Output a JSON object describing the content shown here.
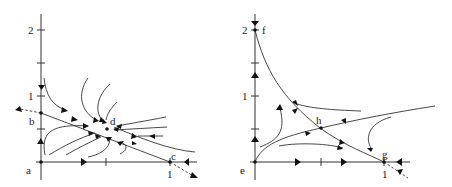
{
  "figure": {
    "panels": [
      {
        "id": "left",
        "y_ticks": [
          {
            "value": 2,
            "label": "2"
          },
          {
            "value": 1,
            "label": "1"
          }
        ],
        "x_ticks": [
          {
            "value": 1,
            "label": "1"
          }
        ],
        "minor_ticks": [
          0.5,
          1.5
        ],
        "points": [
          {
            "label": "a",
            "x": 0,
            "y": 0
          },
          {
            "label": "b",
            "x": 0,
            "y": 0.75
          },
          {
            "label": "c",
            "x": 1,
            "y": 0
          },
          {
            "label": "d",
            "x": 0.5,
            "y": 0.5
          }
        ]
      },
      {
        "id": "right",
        "y_ticks": [
          {
            "value": 2,
            "label": "2"
          },
          {
            "value": 1,
            "label": "1"
          }
        ],
        "x_ticks": [
          {
            "value": 1,
            "label": "1"
          }
        ],
        "minor_ticks": [
          0.5,
          1.5
        ],
        "points": [
          {
            "label": "e",
            "x": 0,
            "y": 0
          },
          {
            "label": "f",
            "x": 0,
            "y": 2
          },
          {
            "label": "g",
            "x": 1,
            "y": 0
          },
          {
            "label": "h",
            "x": 0.5,
            "y": 0.5
          }
        ]
      }
    ]
  }
}
